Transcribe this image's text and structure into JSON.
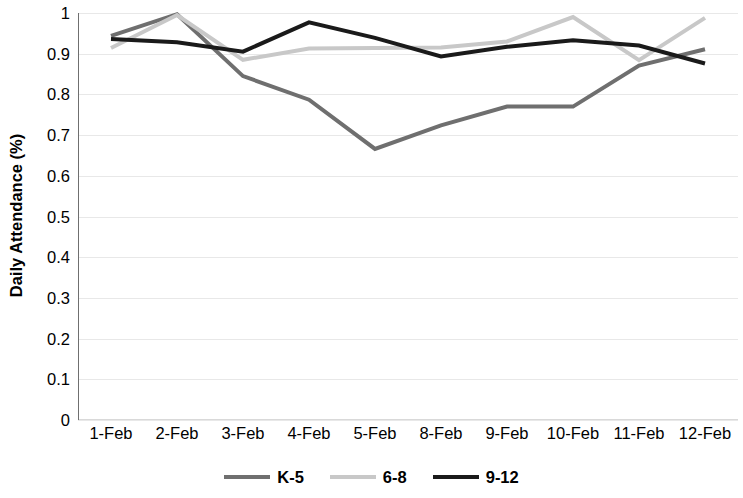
{
  "chart_data": {
    "type": "line",
    "title": "",
    "xlabel": "",
    "ylabel": "Daily Attendance (%)",
    "categories": [
      "1-Feb",
      "2-Feb",
      "3-Feb",
      "4-Feb",
      "5-Feb",
      "8-Feb",
      "9-Feb",
      "10-Feb",
      "11-Feb",
      "12-Feb"
    ],
    "ylim": [
      0,
      1
    ],
    "ytick_labels": [
      "1",
      "0.9",
      "0.8",
      "0.7",
      "0.6",
      "0.5",
      "0.4",
      "0.3",
      "0.2",
      "0.1",
      "0"
    ],
    "ytick_values": [
      1,
      0.9,
      0.8,
      0.7,
      0.6,
      0.5,
      0.4,
      0.3,
      0.2,
      0.1,
      0
    ],
    "grid": true,
    "legend_position": "bottom",
    "series": [
      {
        "name": "K-5",
        "color": "#6f6f6f",
        "values": [
          0.944,
          0.997,
          0.845,
          0.787,
          0.666,
          0.724,
          0.77,
          0.77,
          0.871,
          0.911
        ]
      },
      {
        "name": "6-8",
        "color": "#c8c8c8",
        "values": [
          0.914,
          0.995,
          0.885,
          0.913,
          0.914,
          0.915,
          0.93,
          0.99,
          0.884,
          0.988
        ]
      },
      {
        "name": "9-12",
        "color": "#1a1a1a",
        "values": [
          0.936,
          0.928,
          0.905,
          0.977,
          0.939,
          0.893,
          0.917,
          0.933,
          0.92,
          0.876
        ]
      }
    ]
  },
  "legend": {
    "items": [
      {
        "label": "K-5"
      },
      {
        "label": "6-8"
      },
      {
        "label": "9-12"
      }
    ]
  }
}
